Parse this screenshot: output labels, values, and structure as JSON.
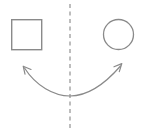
{
  "canvas": {
    "width": 141,
    "height": 135,
    "background_color": "#ffffff",
    "title": "Square and circle reflected across a vertical dashed axis",
    "stroke_color": "#8a8a8a",
    "stroke_width": 1.3
  },
  "shapes": {
    "square": {
      "name": "square",
      "label": "square",
      "x": 11,
      "y": 19,
      "width": 31,
      "height": 31,
      "fill": "none",
      "stroke_color": "#8a8a8a",
      "stroke_width": 1.4
    },
    "circle": {
      "name": "circle",
      "label": "circle",
      "cx": 118.5,
      "cy": 34.5,
      "r": 15.5,
      "fill": "none",
      "stroke_color": "#8a8a8a",
      "stroke_width": 1.3
    }
  },
  "axis": {
    "name": "mirror-axis",
    "label": "axis of symmetry",
    "x": 70,
    "y_start": 4,
    "y_end": 131,
    "stroke_color": "#9a9a9a",
    "stroke_width": 1.3,
    "dash_pattern": "4 3.5"
  },
  "arrow": {
    "name": "double-headed-curved-arrow",
    "label": "maps onto",
    "path": "M 24.5 68 C 36 86 54 96 70 96 C 86 96 104 85 120.5 66",
    "stroke_color": "#8a8a8a",
    "stroke_width": 1.2,
    "left_head": {
      "label": "left-arrowhead",
      "tip_x": 23,
      "tip_y": 66,
      "path": "M 30.5 69.5 L 23 66 L 24.5 74"
    },
    "right_head": {
      "label": "right-arrowhead",
      "tip_x": 122,
      "tip_y": 64,
      "path": "M 114.5 66.5 L 122 64 L 119.5 71.5"
    }
  }
}
